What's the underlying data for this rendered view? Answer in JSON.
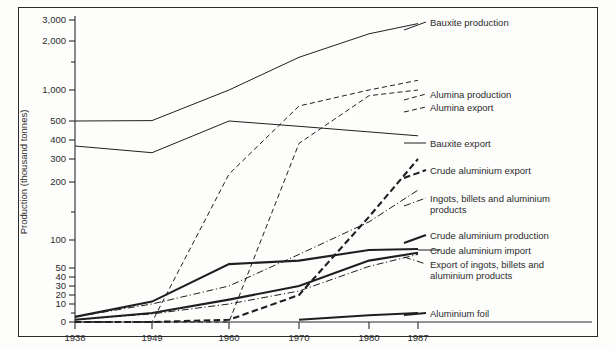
{
  "chart_data": {
    "type": "line",
    "title": "",
    "xlabel": "",
    "ylabel": "Production (thousand tonnes)",
    "scale": "log-like (compressed)",
    "grid": false,
    "legend_position": "right-inline",
    "x": [
      1938,
      1949,
      1960,
      1970,
      1980,
      1987
    ],
    "xticklabels": [
      "1938",
      "1949",
      "1960",
      "1970",
      "1980",
      "1987"
    ],
    "yticklabels": [
      "3,000",
      "2,000",
      "",
      "1,000",
      "500",
      "400",
      "300",
      "200",
      "",
      "100",
      "50",
      "40",
      "30",
      "20",
      "10",
      "",
      "0"
    ],
    "ytickvalues": [
      3000,
      2000,
      1500,
      1000,
      500,
      400,
      300,
      200,
      150,
      100,
      50,
      40,
      30,
      20,
      10,
      5,
      0
    ],
    "ylim": [
      0,
      3500
    ],
    "series": [
      {
        "name": "Bauxite production",
        "label": "Bauxite production",
        "style": "solid-thin",
        "values": [
          500,
          505,
          1000,
          1600,
          2300,
          2800
        ]
      },
      {
        "name": "Alumina production",
        "label": "Alumina production",
        "style": "dashed-thin",
        "values": [
          0,
          0,
          230,
          700,
          1000,
          1150
        ]
      },
      {
        "name": "Alumina export",
        "label": "Alumina export",
        "style": "dashed-thin",
        "values": [
          0,
          0,
          0,
          380,
          880,
          1000
        ]
      },
      {
        "name": "Bauxite export",
        "label": "Bauxite export",
        "style": "solid-thin",
        "values": [
          365,
          330,
          500,
          470,
          440,
          420
        ]
      },
      {
        "name": "Crude aluminium export",
        "label": "Crude aluminium export",
        "style": "dashed-bold",
        "values": [
          0,
          0,
          1,
          20,
          140,
          300
        ]
      },
      {
        "name": "Ingots, billets and aluminium products",
        "label": "Ingots, billets and aluminium products",
        "style": "dash-dot-thin",
        "values": [
          2,
          10,
          30,
          70,
          130,
          185
        ]
      },
      {
        "name": "Crude aluminium production",
        "label": "Crude aluminium production",
        "style": "solid-thick",
        "values": [
          2,
          12,
          55,
          60,
          78,
          80
        ]
      },
      {
        "name": "Crude aluminium import",
        "label": "Crude aluminium import",
        "style": "solid-thick",
        "values": [
          1,
          5,
          14,
          30,
          60,
          73
        ]
      },
      {
        "name": "Export of ingots, billets and aluminium products",
        "label": "Export of ingots, billets and aluminium products",
        "style": "dash-dot-thin",
        "values": [
          1,
          4,
          10,
          24,
          52,
          70
        ]
      },
      {
        "name": "Aluminium foil",
        "label": "Aluminium foil",
        "style": "solid-thick",
        "values": [
          null,
          null,
          null,
          1,
          3,
          5
        ]
      }
    ],
    "right_labels": [
      {
        "text": "Bauxite production",
        "y": 22
      },
      {
        "text": "Alumina production",
        "y": 94
      },
      {
        "text": "Alumina export",
        "y": 107
      },
      {
        "text": "Bauxite export",
        "y": 143
      },
      {
        "text": "Crude aluminium export",
        "y": 170
      },
      {
        "text": "Ingots, billets and aluminium",
        "y": 198
      },
      {
        "text": "products",
        "y": 209
      },
      {
        "text": "Crude aluminium production",
        "y": 235
      },
      {
        "text": "Crude aluminium import",
        "y": 250
      },
      {
        "text": "Export of ingots, billets and",
        "y": 264
      },
      {
        "text": "aluminium products",
        "y": 275
      },
      {
        "text": "Aluminium foil",
        "y": 313
      }
    ]
  },
  "axis": {
    "y_title": "Production (thousand tonnes)",
    "y_ticks": [
      {
        "label": "3,000",
        "y": 20
      },
      {
        "label": "2,000",
        "y": 41
      },
      {
        "label": "",
        "y": 62
      },
      {
        "label": "1,000",
        "y": 90
      },
      {
        "label": "500",
        "y": 121
      },
      {
        "label": "400",
        "y": 140
      },
      {
        "label": "300",
        "y": 159
      },
      {
        "label": "200",
        "y": 182
      },
      {
        "label": "",
        "y": 212
      },
      {
        "label": "100",
        "y": 240
      },
      {
        "label": "50",
        "y": 268
      },
      {
        "label": "40",
        "y": 277
      },
      {
        "label": "30",
        "y": 286
      },
      {
        "label": "20",
        "y": 295
      },
      {
        "label": "10",
        "y": 304
      },
      {
        "label": "",
        "y": 313
      },
      {
        "label": "0",
        "y": 322
      }
    ],
    "x_ticks": [
      {
        "label": "1938",
        "x": 75
      },
      {
        "label": "1949",
        "x": 152
      },
      {
        "label": "1960",
        "x": 229
      },
      {
        "label": "1970",
        "x": 299
      },
      {
        "label": "1980",
        "x": 369
      },
      {
        "label": "1987",
        "x": 418
      }
    ]
  },
  "colors": {
    "ink": "#1f1f1f",
    "frame": "#2b2b2b",
    "paper": "#fdfdfc"
  }
}
